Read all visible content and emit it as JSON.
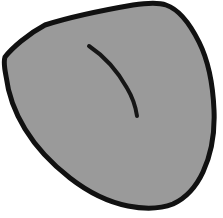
{
  "figure": {
    "canvas": {
      "width": 223,
      "height": 218,
      "background_color": "#ffffff"
    },
    "colors": {
      "background": "#ffffff",
      "fill": "#9a9a9a",
      "outline": "#111111",
      "interior_stroke": "#161616"
    },
    "shapes": [
      {
        "name": "blob-outline",
        "kind": "closed-path",
        "fill_color": "#9a9a9a",
        "stroke_color": "#111111",
        "stroke_width": 5,
        "path": "M 45 25 C 70 17 104 10 133 5 C 146 3 158 2 166 5 C 178 9 190 24 199 42 C 208 60 213 86 214 110 C 215 133 211 155 203 172 C 196 187 186 198 173 204 C 160 209 143 209 128 206 C 108 202 88 192 70 178 C 52 164 36 147 25 129 C 14 111 8 92 6 76 C 4 66 4 60 5 57 C 12 48 28 34 45 25 Z",
        "bbox": {
          "x": 4,
          "y": 2,
          "width": 211,
          "height": 207
        }
      },
      {
        "name": "interior-curve",
        "kind": "open-path",
        "stroke_color": "#161616",
        "stroke_width": 4,
        "path": "M 89 46 C 104 56 118 72 127 88 C 133 98 136 109 137 116",
        "endpoints": [
          [
            89,
            46
          ],
          [
            137,
            116
          ]
        ]
      }
    ]
  }
}
